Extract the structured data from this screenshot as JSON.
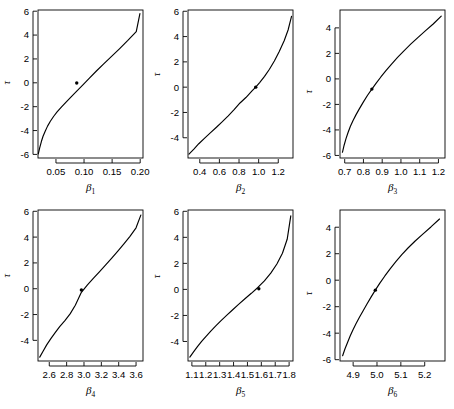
{
  "figure": {
    "background": "#ffffff",
    "foreground": "#000000",
    "rows": 2,
    "cols": 3,
    "width": 454,
    "height": 409
  },
  "chart_data": [
    {
      "type": "line",
      "panel_index": 1,
      "title": "",
      "xlabel": "β",
      "xlabel_sub": "1",
      "ylabel": "τ",
      "xlim": [
        0.018,
        0.205
      ],
      "ylim": [
        -6.3,
        6.1
      ],
      "xticks": [
        0.05,
        0.1,
        0.15,
        0.2
      ],
      "xticklabels": [
        "0.05",
        "0.10",
        "0.15",
        "0.20"
      ],
      "yticks": [
        -6,
        -4,
        -2,
        0,
        2,
        4,
        6
      ],
      "yticklabels": [
        "-6",
        "-4",
        "-2",
        "0",
        "2",
        "4",
        "6"
      ],
      "grid": false,
      "legend": "none",
      "x": [
        0.0185,
        0.021,
        0.024,
        0.027,
        0.031,
        0.035,
        0.04,
        0.046,
        0.052,
        0.06,
        0.068,
        0.077,
        0.087,
        0.098,
        0.11,
        0.122,
        0.135,
        0.149,
        0.163,
        0.178,
        0.193,
        0.1995
      ],
      "y": [
        -5.95,
        -5.45,
        -4.92,
        -4.48,
        -4.03,
        -3.63,
        -3.22,
        -2.8,
        -2.44,
        -2.02,
        -1.62,
        -1.18,
        -0.7,
        -0.17,
        0.42,
        0.99,
        1.58,
        2.21,
        2.85,
        3.55,
        4.29,
        5.8
      ],
      "annotation": {
        "label": "point-estimate",
        "x": 0.087,
        "y": -0.02
      }
    },
    {
      "type": "line",
      "panel_index": 2,
      "title": "",
      "xlabel": "β",
      "xlabel_sub": "2",
      "ylabel": "τ",
      "xlim": [
        0.28,
        1.35
      ],
      "ylim": [
        -5.6,
        6.1
      ],
      "xticks": [
        0.4,
        0.6,
        0.8,
        1.0,
        1.2
      ],
      "xticklabels": [
        "0.4",
        "0.6",
        "0.8",
        "1.0",
        "1.2"
      ],
      "yticks": [
        -4,
        -2,
        0,
        2,
        4,
        6
      ],
      "yticklabels": [
        "-4",
        "-2",
        "0",
        "2",
        "4",
        "6"
      ],
      "grid": false,
      "legend": "none",
      "x": [
        0.29,
        0.34,
        0.39,
        0.45,
        0.51,
        0.57,
        0.63,
        0.69,
        0.75,
        0.81,
        0.87,
        0.93,
        0.97,
        1.01,
        1.06,
        1.11,
        1.16,
        1.21,
        1.26,
        1.3,
        1.335
      ],
      "y": [
        -5.3,
        -4.9,
        -4.47,
        -4.03,
        -3.6,
        -3.17,
        -2.73,
        -2.27,
        -1.78,
        -1.25,
        -0.82,
        -0.32,
        0.0,
        0.36,
        0.85,
        1.42,
        2.07,
        2.82,
        3.67,
        4.52,
        5.6
      ],
      "annotation": {
        "label": "point-estimate",
        "x": 0.97,
        "y": 0.0
      }
    },
    {
      "type": "line",
      "panel_index": 3,
      "title": "",
      "xlabel": "β",
      "xlabel_sub": "3",
      "ylabel": "τ",
      "xlim": [
        0.675,
        1.235
      ],
      "ylim": [
        -6.2,
        5.4
      ],
      "xticks": [
        0.7,
        0.8,
        0.9,
        1.0,
        1.1,
        1.2
      ],
      "xticklabels": [
        "0.7",
        "0.8",
        "0.9",
        "1.0",
        "1.1",
        "1.2"
      ],
      "yticks": [
        -6,
        -4,
        -2,
        0,
        2,
        4
      ],
      "yticklabels": [
        "-6",
        "-4",
        "-2",
        "0",
        "2",
        "4"
      ],
      "grid": false,
      "legend": "none",
      "x": [
        0.688,
        0.697,
        0.707,
        0.718,
        0.73,
        0.744,
        0.76,
        0.778,
        0.8,
        0.822,
        0.845,
        0.868,
        0.893,
        0.92,
        0.95,
        0.982,
        1.016,
        1.052,
        1.09,
        1.13,
        1.172,
        1.215
      ],
      "y": [
        -5.75,
        -5.2,
        -4.68,
        -4.2,
        -3.73,
        -3.28,
        -2.82,
        -2.35,
        -1.8,
        -1.28,
        -0.8,
        -0.33,
        0.15,
        0.64,
        1.16,
        1.68,
        2.2,
        2.72,
        3.24,
        3.76,
        4.3,
        4.92
      ],
      "annotation": {
        "label": "point-estimate",
        "x": 0.845,
        "y": -0.8
      }
    },
    {
      "type": "line",
      "panel_index": 4,
      "title": "",
      "xlabel": "β",
      "xlabel_sub": "4",
      "ylabel": "τ",
      "xlim": [
        2.47,
        3.68
      ],
      "ylim": [
        -5.6,
        6.1
      ],
      "xticks": [
        2.6,
        2.8,
        3.0,
        3.2,
        3.4,
        3.6
      ],
      "xticklabels": [
        "2.6",
        "2.8",
        "3.0",
        "3.2",
        "3.4",
        "3.6"
      ],
      "yticks": [
        -4,
        -2,
        0,
        2,
        4,
        6
      ],
      "yticklabels": [
        "-4",
        "-2",
        "0",
        "2",
        "4",
        "6"
      ],
      "grid": false,
      "legend": "none",
      "x": [
        2.49,
        2.53,
        2.57,
        2.62,
        2.67,
        2.72,
        2.78,
        2.84,
        2.9,
        2.97,
        3.04,
        3.11,
        3.18,
        3.25,
        3.32,
        3.39,
        3.46,
        3.53,
        3.6,
        3.655
      ],
      "y": [
        -5.3,
        -4.82,
        -4.35,
        -3.85,
        -3.38,
        -2.93,
        -2.47,
        -1.95,
        -1.28,
        -0.28,
        0.3,
        0.82,
        1.33,
        1.85,
        2.38,
        2.92,
        3.48,
        4.06,
        4.72,
        5.7
      ],
      "annotation": {
        "label": "point-estimate",
        "x": 2.97,
        "y": -0.1
      }
    },
    {
      "type": "line",
      "panel_index": 5,
      "title": "",
      "xlabel": "β",
      "xlabel_sub": "5",
      "ylabel": "τ",
      "xlim": [
        1.072,
        1.828
      ],
      "ylim": [
        -5.5,
        6.1
      ],
      "xticks": [
        1.1,
        1.2,
        1.3,
        1.4,
        1.5,
        1.6,
        1.7,
        1.8
      ],
      "xticklabels": [
        "1.1",
        "1.2",
        "1.3",
        "1.4",
        "1.5",
        "1.6",
        "1.7",
        "1.8"
      ],
      "yticks": [
        -4,
        -2,
        0,
        2,
        4,
        6
      ],
      "yticklabels": [
        "-4",
        "-2",
        "0",
        "2",
        "4",
        "6"
      ],
      "grid": false,
      "legend": "none",
      "x": [
        1.085,
        1.112,
        1.14,
        1.17,
        1.202,
        1.236,
        1.272,
        1.31,
        1.35,
        1.392,
        1.436,
        1.482,
        1.528,
        1.575,
        1.622,
        1.668,
        1.712,
        1.752,
        1.786,
        1.812
      ],
      "y": [
        -5.2,
        -4.8,
        -4.4,
        -4.0,
        -3.6,
        -3.2,
        -2.8,
        -2.4,
        -2.0,
        -1.58,
        -1.15,
        -0.72,
        -0.3,
        0.15,
        0.65,
        1.25,
        1.95,
        2.78,
        3.85,
        5.65
      ],
      "annotation": {
        "label": "point-estimate",
        "x": 1.582,
        "y": 0.05
      }
    },
    {
      "type": "line",
      "panel_index": 6,
      "title": "",
      "xlabel": "β",
      "xlabel_sub": "6",
      "ylabel": "τ",
      "xlim": [
        4.845,
        5.285
      ],
      "ylim": [
        -6.1,
        5.3
      ],
      "xticks": [
        4.9,
        5.0,
        5.1,
        5.2
      ],
      "xticklabels": [
        "4.9",
        "5.0",
        "5.1",
        "5.2"
      ],
      "yticks": [
        -6,
        -4,
        -2,
        0,
        2,
        4
      ],
      "yticklabels": [
        "-6",
        "-4",
        "-2",
        "0",
        "2",
        "4"
      ],
      "grid": false,
      "legend": "none",
      "x": [
        4.856,
        4.866,
        4.877,
        4.888,
        4.9,
        4.913,
        4.927,
        4.942,
        4.958,
        4.975,
        4.993,
        5.012,
        5.033,
        5.055,
        5.079,
        5.104,
        5.131,
        5.16,
        5.192,
        5.226,
        5.262
      ],
      "y": [
        -5.7,
        -5.18,
        -4.68,
        -4.2,
        -3.72,
        -3.25,
        -2.78,
        -2.3,
        -1.8,
        -1.28,
        -0.75,
        -0.22,
        0.32,
        0.86,
        1.4,
        1.93,
        2.45,
        2.96,
        3.48,
        4.02,
        4.62
      ],
      "annotation": {
        "label": "point-estimate",
        "x": 4.993,
        "y": -0.75
      }
    }
  ]
}
